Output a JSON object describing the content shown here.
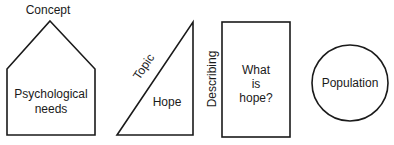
{
  "diagram": {
    "shapes": [
      {
        "kind": "pentagon",
        "outer_label": "Concept",
        "inner_lines": [
          "Psychological",
          "needs"
        ]
      },
      {
        "kind": "right-triangle",
        "outer_label": "Topic",
        "inner_lines": [
          "Hope"
        ]
      },
      {
        "kind": "rectangle",
        "outer_label": "Describing",
        "inner_lines": [
          "What",
          "is",
          "hope?"
        ]
      },
      {
        "kind": "circle",
        "outer_label": "",
        "inner_lines": [
          "Population"
        ]
      }
    ],
    "colors": {
      "stroke": "#1a1a1a",
      "background": "#ffffff"
    }
  }
}
